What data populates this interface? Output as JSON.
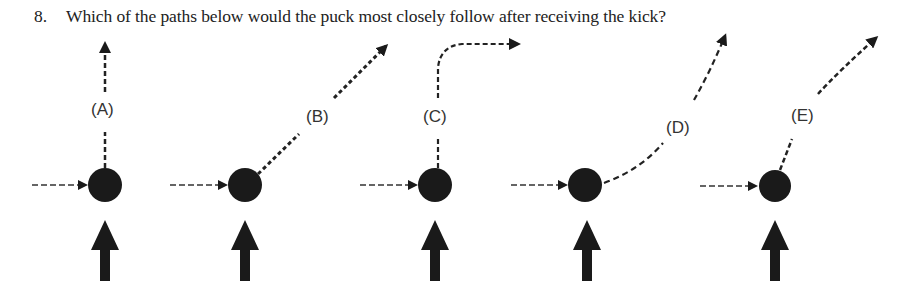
{
  "question": {
    "number": "8.",
    "text": "Which of the paths below would the puck most closely follow after receiving the kick?"
  },
  "options": [
    {
      "label": "(A)",
      "path_description": "straight up (vertical)"
    },
    {
      "label": "(B)",
      "path_description": "straight diagonal up-right at ~45°"
    },
    {
      "label": "(C)",
      "path_description": "straight up, then curves right to horizontal"
    },
    {
      "label": "(D)",
      "path_description": "curves from right-ish to nearly vertical up-right"
    },
    {
      "label": "(E)",
      "path_description": "diagonal up-right, steep then shallower"
    }
  ],
  "colors": {
    "puck": "#1a1a1a",
    "arrow": "#1a1a1a",
    "text": "#222222",
    "background": "#ffffff"
  }
}
